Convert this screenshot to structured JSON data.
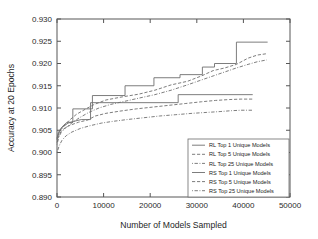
{
  "chart_data": {
    "type": "line",
    "title": "",
    "xlabel": "Number of Models Sampled",
    "ylabel": "Accuracy at 20 Epochs",
    "xlim": [
      0,
      50000
    ],
    "ylim": [
      0.89,
      0.93
    ],
    "xticks": [
      0,
      10000,
      20000,
      30000,
      40000,
      50000
    ],
    "xtick_labels": [
      "0",
      "10000",
      "20000",
      "30000",
      "40000",
      "50000"
    ],
    "yticks": [
      0.89,
      0.895,
      0.9,
      0.905,
      0.91,
      0.915,
      0.92,
      0.925,
      0.93
    ],
    "ytick_labels": [
      "0.890",
      "0.895",
      "0.900",
      "0.905",
      "0.910",
      "0.915",
      "0.920",
      "0.925",
      "0.930"
    ],
    "grid": false,
    "legend_position": "lower right",
    "line_color": "#6e6e6e",
    "series": [
      {
        "name": "RL Top 1 Unique Models",
        "style": "solid",
        "dasharray": "",
        "step": true,
        "x": [
          0,
          300,
          900,
          1500,
          2200,
          3400,
          3400,
          7600,
          7600,
          14600,
          14600,
          20800,
          20800,
          26400,
          26400,
          31200,
          31200,
          33800,
          33800,
          38500,
          38500,
          45200
        ],
        "y": [
          0.9032,
          0.9045,
          0.9055,
          0.9062,
          0.9068,
          0.9068,
          0.9098,
          0.9098,
          0.9128,
          0.9128,
          0.915,
          0.915,
          0.9168,
          0.9168,
          0.9175,
          0.9175,
          0.9192,
          0.9192,
          0.92,
          0.92,
          0.9248,
          0.9248
        ]
      },
      {
        "name": "RL Top 5 Unique Models",
        "style": "dashed",
        "dasharray": "3.2,1.8",
        "step": false,
        "x": [
          0,
          400,
          900,
          1600,
          2600,
          4200,
          6200,
          8000,
          10500,
          14000,
          17500,
          21000,
          24500,
          28000,
          31000,
          33500,
          36000,
          38500,
          41000,
          43000,
          45000
        ],
        "y": [
          0.9028,
          0.9042,
          0.9052,
          0.906,
          0.9072,
          0.9086,
          0.9098,
          0.9108,
          0.9118,
          0.9125,
          0.9131,
          0.914,
          0.9152,
          0.916,
          0.9172,
          0.9184,
          0.919,
          0.9198,
          0.9212,
          0.9219,
          0.9222
        ]
      },
      {
        "name": "RL Top 25 Unique Models",
        "style": "dashdot",
        "dasharray": "0.9,1.6,3.4,1.6",
        "step": false,
        "x": [
          0,
          400,
          900,
          1800,
          3000,
          4800,
          6800,
          9000,
          11500,
          14500,
          17500,
          21000,
          24500,
          28000,
          31000,
          33500,
          36000,
          38500,
          41000,
          43000,
          45000
        ],
        "y": [
          0.9018,
          0.9035,
          0.9045,
          0.9055,
          0.9065,
          0.9078,
          0.909,
          0.91,
          0.9108,
          0.9115,
          0.9122,
          0.913,
          0.914,
          0.9152,
          0.9163,
          0.9172,
          0.9181,
          0.919,
          0.9198,
          0.9204,
          0.9208
        ]
      },
      {
        "name": "RS Top 1 Unique Models",
        "style": "solid",
        "dasharray": "",
        "step": true,
        "x": [
          0,
          300,
          800,
          1500,
          2400,
          3600,
          5200,
          7200,
          7200,
          26000,
          26000,
          42000
        ],
        "y": [
          0.903,
          0.9043,
          0.9053,
          0.906,
          0.9066,
          0.907,
          0.9074,
          0.9074,
          0.9112,
          0.9112,
          0.913,
          0.913
        ]
      },
      {
        "name": "RS Top 5 Unique Models",
        "style": "dashed",
        "dasharray": "3.2,1.8",
        "step": false,
        "x": [
          0,
          400,
          900,
          1800,
          3000,
          4600,
          6600,
          8200,
          10500,
          13500,
          17000,
          20500,
          24000,
          27500,
          31000,
          34000,
          37000,
          39500,
          41000,
          42000
        ],
        "y": [
          0.9022,
          0.9038,
          0.9048,
          0.9056,
          0.9062,
          0.9068,
          0.9073,
          0.9082,
          0.9088,
          0.9093,
          0.9098,
          0.9102,
          0.9106,
          0.911,
          0.9114,
          0.9117,
          0.9119,
          0.912,
          0.912,
          0.912
        ]
      },
      {
        "name": "RS Top 25 Unique Models",
        "style": "dashdot",
        "dasharray": "0.9,1.6,3.4,1.6",
        "step": false,
        "x": [
          0,
          500,
          1100,
          2000,
          3200,
          5000,
          7000,
          9500,
          12000,
          15000,
          18500,
          22000,
          25500,
          29000,
          32000,
          35000,
          37500,
          39500,
          41000,
          42000
        ],
        "y": [
          0.9,
          0.9016,
          0.9028,
          0.9038,
          0.9046,
          0.9054,
          0.906,
          0.9066,
          0.907,
          0.9074,
          0.9078,
          0.9082,
          0.9085,
          0.9088,
          0.909,
          0.9092,
          0.9094,
          0.9095,
          0.9095,
          0.9095
        ]
      }
    ]
  },
  "legend": {
    "items": [
      {
        "label": "RL Top 1 Unique Models"
      },
      {
        "label": "RL Top 5 Unique Models"
      },
      {
        "label": "RL Top 25 Unique Models"
      },
      {
        "label": "RS Top 1 Unique Models"
      },
      {
        "label": "RS Top 5 Unique Models"
      },
      {
        "label": "RS Top 25 Unique Models"
      }
    ]
  }
}
